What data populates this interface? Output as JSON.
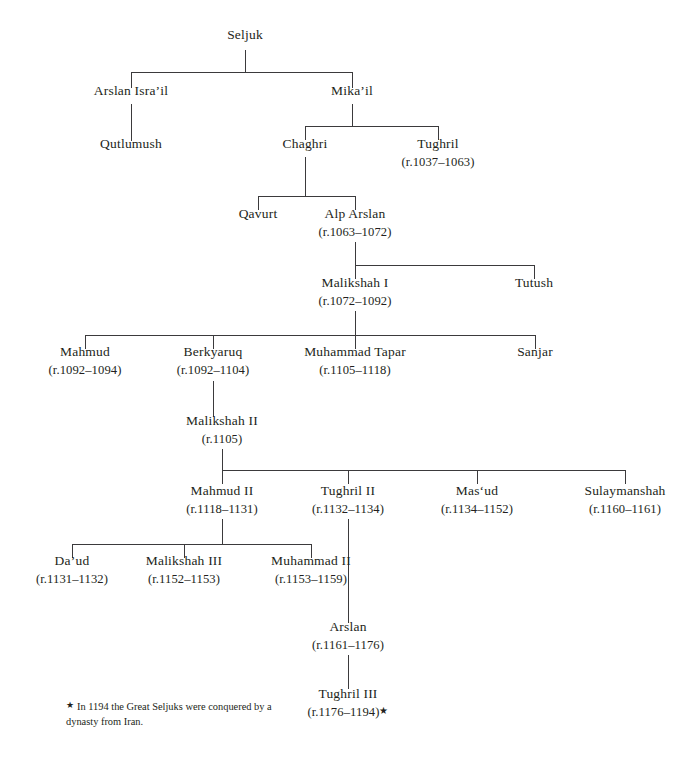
{
  "diagram": {
    "type": "genealogy-tree",
    "line_color": "#3b3a3c",
    "background_color": "#ffffff",
    "text_color": "#231f20",
    "footnote": {
      "marker": "★",
      "text": "In 1194 the Great Seljuks were conquered by a dynasty from Iran."
    },
    "nodes": [
      {
        "id": "seljuk",
        "name": "Seljuk",
        "reign": "",
        "x": 245,
        "y": 33,
        "generation": 0
      },
      {
        "id": "arslan-israil",
        "name": "Arslan Isra’il",
        "reign": "",
        "x": 131,
        "y": 89,
        "generation": 1
      },
      {
        "id": "mikail",
        "name": "Mika’il",
        "reign": "",
        "x": 352,
        "y": 89,
        "generation": 1
      },
      {
        "id": "qutlumush",
        "name": "Qutlumush",
        "reign": "",
        "x": 131,
        "y": 142,
        "generation": 2
      },
      {
        "id": "chaghri",
        "name": "Chaghri",
        "reign": "",
        "x": 305,
        "y": 142,
        "generation": 2
      },
      {
        "id": "tughril",
        "name": "Tughril",
        "reign": "(r.1037–1063)",
        "x": 438,
        "y": 142,
        "generation": 2
      },
      {
        "id": "qavurt",
        "name": "Qavurt",
        "reign": "",
        "x": 258,
        "y": 212,
        "generation": 3
      },
      {
        "id": "alp-arslan",
        "name": "Alp Arslan",
        "reign": "(r.1063–1072)",
        "x": 355,
        "y": 212,
        "generation": 3
      },
      {
        "id": "malikshah-i",
        "name": "Malikshah I",
        "reign": "(r.1072–1092)",
        "x": 355,
        "y": 281,
        "generation": 4
      },
      {
        "id": "tutush",
        "name": "Tutush",
        "reign": "",
        "x": 534,
        "y": 281,
        "generation": 4
      },
      {
        "id": "mahmud",
        "name": "Mahmud",
        "reign": "(r.1092–1094)",
        "x": 85,
        "y": 350,
        "generation": 5
      },
      {
        "id": "berkyaruq",
        "name": "Berkyaruq",
        "reign": "(r.1092–1104)",
        "x": 213,
        "y": 350,
        "generation": 5
      },
      {
        "id": "muhammad-tapar",
        "name": "Muhammad Tapar",
        "reign": "(r.1105–1118)",
        "x": 355,
        "y": 350,
        "generation": 5
      },
      {
        "id": "sanjar",
        "name": "Sanjar",
        "reign": "",
        "x": 535,
        "y": 350,
        "generation": 5
      },
      {
        "id": "malikshah-ii",
        "name": "Malikshah II",
        "reign": "(r.1105)",
        "x": 222,
        "y": 419,
        "generation": 6
      },
      {
        "id": "mahmud-ii",
        "name": "Mahmud II",
        "reign": "(r.1118–1131)",
        "x": 222,
        "y": 489,
        "generation": 7
      },
      {
        "id": "tughril-ii",
        "name": "Tughril II",
        "reign": "(r.1132–1134)",
        "x": 348,
        "y": 489,
        "generation": 7
      },
      {
        "id": "masud",
        "name": "Mas‘ud",
        "reign": "(r.1134–1152)",
        "x": 477,
        "y": 489,
        "generation": 7
      },
      {
        "id": "sulaymanshah",
        "name": "Sulaymanshah",
        "reign": "(r.1160–1161)",
        "x": 625,
        "y": 489,
        "generation": 7
      },
      {
        "id": "daud",
        "name": "Da’ud",
        "reign": "(r.1131–1132)",
        "x": 72,
        "y": 559,
        "generation": 8
      },
      {
        "id": "malikshah-iii",
        "name": "Malikshah III",
        "reign": "(r.1152–1153)",
        "x": 184,
        "y": 559,
        "generation": 8
      },
      {
        "id": "muhammad-ii",
        "name": "Muhammad II",
        "reign": "(r.1153–1159)",
        "x": 311,
        "y": 559,
        "generation": 8
      },
      {
        "id": "arslan",
        "name": "Arslan",
        "reign": "(r.1161–1176)",
        "x": 348,
        "y": 625,
        "generation": 9
      },
      {
        "id": "tughril-iii",
        "name": "Tughril III",
        "reign": "(r.1176–1194)",
        "reign_star": "★",
        "x": 348,
        "y": 692,
        "generation": 10
      }
    ],
    "edges": [
      {
        "from": "seljuk",
        "to": [
          "arslan-israil",
          "mikail"
        ]
      },
      {
        "from": "arslan-israil",
        "to": [
          "qutlumush"
        ]
      },
      {
        "from": "mikail",
        "to": [
          "chaghri",
          "tughril"
        ]
      },
      {
        "from": "chaghri",
        "to": [
          "qavurt",
          "alp-arslan"
        ]
      },
      {
        "from": "alp-arslan",
        "to": [
          "malikshah-i",
          "tutush"
        ]
      },
      {
        "from": "malikshah-i",
        "to": [
          "mahmud",
          "berkyaruq",
          "muhammad-tapar",
          "sanjar"
        ]
      },
      {
        "from": "berkyaruq",
        "to": [
          "malikshah-ii"
        ]
      },
      {
        "from": "malikshah-ii",
        "to": [
          "mahmud-ii",
          "tughril-ii",
          "masud",
          "sulaymanshah"
        ]
      },
      {
        "from": "mahmud-ii",
        "to": [
          "daud",
          "malikshah-iii",
          "muhammad-ii"
        ]
      },
      {
        "from": "tughril-ii",
        "to": [
          "arslan"
        ]
      },
      {
        "from": "arslan",
        "to": [
          "tughril-iii"
        ]
      }
    ]
  }
}
